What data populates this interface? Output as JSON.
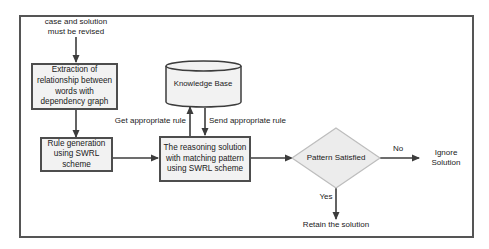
{
  "diagram": {
    "start_note": {
      "line1": "case and solution",
      "line2": "must be revised"
    },
    "nodes": {
      "extraction": {
        "line1": "Extraction of",
        "line2": "relationship between",
        "line3": "words with",
        "line4": "dependency graph"
      },
      "rule_generation": {
        "line1": "Rule generation",
        "line2": "using SWRL",
        "line3": "scheme"
      },
      "knowledge_base": {
        "label": "Knowledge Base"
      },
      "reasoning": {
        "line1": "The reasoning solution",
        "line2": "with matching pattern",
        "line3": "using SWRL scheme"
      },
      "decision": {
        "label": "Pattern Satisfied"
      },
      "ignore": {
        "line1": "Ignore",
        "line2": "Solution"
      },
      "retain": {
        "label": "Retain the solution"
      }
    },
    "edges": {
      "get_rule": "Get appropriate rule",
      "send_rule": "Send appropriate rule",
      "no": "No",
      "yes": "Yes"
    },
    "colors": {
      "box_fill": "#f2f2f2",
      "box_stroke": "#4d4d4d",
      "diamond_fill": "#ececec",
      "diamond_stroke": "#bdbdbd",
      "arrow": "#3c3c3c",
      "frame": "#555555"
    }
  }
}
